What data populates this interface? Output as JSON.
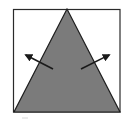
{
  "diagram": {
    "type": "geometric-figure",
    "colors": {
      "background": "#ffffff",
      "frame_stroke": "#2a2a2a",
      "triangle_fill": "#7b7b7b",
      "triangle_stroke": "#1e1e1e",
      "arrow_color": "#1a1a1a"
    },
    "frame": {
      "x": 13,
      "y": 9,
      "width": 107,
      "height": 103
    },
    "triangle": {
      "apex": [
        67,
        9
      ],
      "base_left": [
        14,
        112
      ],
      "base_right": [
        120,
        112
      ]
    },
    "arrows": [
      {
        "name": "left-arrow",
        "from": [
          53,
          69
        ],
        "to": [
          24,
          54
        ],
        "direction": "up-left"
      },
      {
        "name": "right-arrow",
        "from": [
          81,
          69
        ],
        "to": [
          111,
          54
        ],
        "direction": "up-right"
      }
    ]
  }
}
